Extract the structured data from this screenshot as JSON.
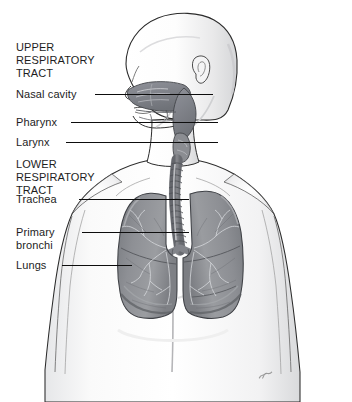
{
  "figure": {
    "style": "grayscale pencil/airbrush anatomical illustration",
    "view": "head in left profile with sagittal cutaway, chest in anterior view",
    "background_color": "#ffffff",
    "ink_color": "#1d1d1d",
    "organ_fill": "#8d8f93",
    "skin_fill": "#fbfbfb"
  },
  "headings": {
    "upper": "UPPER\nRESPIRATORY\nTRACT",
    "lower": "LOWER\nRESPIRATORY\nTRACT"
  },
  "labels": [
    {
      "id": "nasal-cavity",
      "text": "Nasal cavity"
    },
    {
      "id": "pharynx",
      "text": "Pharynx"
    },
    {
      "id": "larynx",
      "text": "Larynx"
    },
    {
      "id": "trachea",
      "text": "Trachea"
    },
    {
      "id": "primary-bronchi",
      "text": "Primary\nbronchi"
    },
    {
      "id": "lungs",
      "text": "Lungs"
    }
  ],
  "signature": "artist mark"
}
